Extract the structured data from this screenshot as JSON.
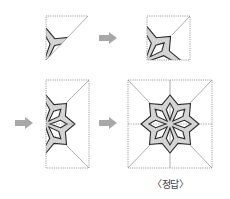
{
  "caption": "〈정답〉",
  "colors": {
    "fold_line": "#8a8a8a",
    "outline": "#2a2a2a",
    "fill": "#d4d4d4",
    "arrow": "#a8a8a8"
  },
  "panels": [
    {
      "id": "step1-triangle",
      "shape": "triangle",
      "x": 46,
      "y": 16,
      "w": 42,
      "h": 44
    },
    {
      "id": "step2-square",
      "shape": "square",
      "x": 147,
      "y": 16,
      "w": 43,
      "h": 44
    },
    {
      "id": "step3-half",
      "shape": "half",
      "x": 46,
      "y": 80,
      "w": 43,
      "h": 88
    },
    {
      "id": "step4-full",
      "shape": "full",
      "x": 128,
      "y": 80,
      "w": 84,
      "h": 88
    }
  ],
  "arrows": [
    {
      "id": "arrow-1",
      "x": 99,
      "y": 38
    },
    {
      "id": "arrow-2",
      "x": 15,
      "y": 123
    },
    {
      "id": "arrow-3",
      "x": 99,
      "y": 123
    }
  ]
}
